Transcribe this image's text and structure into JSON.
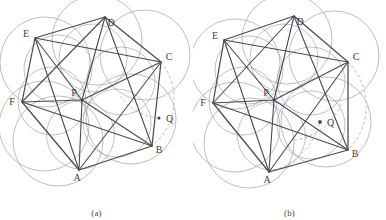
{
  "figure": {
    "type": "geometric-diagram",
    "background": "#ffffff",
    "width": 386,
    "height": 220,
    "stroke_colors": {
      "circle": "#8d8f9b",
      "polygon": "#4a4a52",
      "diagonal": "#4a4a52",
      "dashed_arc": "#b3b0ae",
      "point": "#3c3c3c"
    }
  },
  "panels": [
    {
      "id": "panel-a",
      "caption": "(a)",
      "origin_x": 0,
      "center": {
        "label": "P",
        "x": 82,
        "y": 100,
        "label_dx": -8,
        "label_dy": -4
      },
      "radius": 48,
      "circle_radius": 34,
      "vertices": [
        {
          "label": "A",
          "x": 79,
          "y": 170,
          "label_dx": -2,
          "label_dy": 11
        },
        {
          "label": "B",
          "x": 152,
          "y": 146,
          "label_dx": 7,
          "label_dy": 7
        },
        {
          "label": "C",
          "x": 161,
          "y": 62,
          "label_dx": 8,
          "label_dy": -2
        },
        {
          "label": "D",
          "x": 105,
          "y": 17,
          "label_dx": 6,
          "label_dy": 9
        },
        {
          "label": "E",
          "x": 35,
          "y": 38,
          "label_dx": -9,
          "label_dy": -1
        },
        {
          "label": "F",
          "x": 22,
          "y": 102,
          "label_dx": -10,
          "label_dy": 3
        }
      ],
      "marked_point": {
        "label": "Q",
        "x": 159,
        "y": 118,
        "marker": "dot",
        "label_dx": 7,
        "label_dy": 4
      },
      "circle_centers": [
        {
          "x": 80.5,
          "y": 135
        },
        {
          "x": 117,
          "y": 123
        },
        {
          "x": 121,
          "y": 81
        },
        {
          "x": 93,
          "y": 58
        },
        {
          "x": 58,
          "y": 69
        },
        {
          "x": 52,
          "y": 101
        }
      ],
      "outer_circles": [
        {
          "x": 58,
          "y": 141,
          "r": 45
        },
        {
          "x": 131,
          "y": 119,
          "r": 45
        },
        {
          "x": 145,
          "y": 55,
          "r": 45
        },
        {
          "x": 97,
          "y": 40,
          "r": 45
        },
        {
          "x": 45,
          "y": 62,
          "r": 45
        },
        {
          "x": 44,
          "y": 126,
          "r": 45
        }
      ],
      "diagonals": [
        [
          "P",
          "A"
        ],
        [
          "P",
          "B"
        ],
        [
          "P",
          "C"
        ],
        [
          "P",
          "D"
        ],
        [
          "P",
          "E"
        ],
        [
          "P",
          "F"
        ],
        [
          "A",
          "C"
        ],
        [
          "C",
          "E"
        ],
        [
          "E",
          "A"
        ],
        [
          "B",
          "D"
        ],
        [
          "D",
          "F"
        ],
        [
          "F",
          "B"
        ]
      ],
      "dashed_arcs": [
        {
          "from": [
            161,
            62
          ],
          "to": [
            152,
            146
          ],
          "sweep": 1,
          "r": 60
        },
        {
          "from": [
            120,
            96
          ],
          "to": [
            159,
            118
          ],
          "sweep": 0,
          "r": 52
        }
      ]
    },
    {
      "id": "panel-b",
      "caption": "(b)",
      "origin_x": 193,
      "center": {
        "label": "P",
        "x": 81,
        "y": 100,
        "label_dx": -8,
        "label_dy": -4
      },
      "radius": 48,
      "circle_radius": 34,
      "vertices": [
        {
          "label": "A",
          "x": 76,
          "y": 172,
          "label_dx": -2,
          "label_dy": 11
        },
        {
          "label": "B",
          "x": 155,
          "y": 150,
          "label_dx": 7,
          "label_dy": 7
        },
        {
          "label": "C",
          "x": 155,
          "y": 62,
          "label_dx": 8,
          "label_dy": -2
        },
        {
          "label": "D",
          "x": 101,
          "y": 16,
          "label_dx": 6,
          "label_dy": 9
        },
        {
          "label": "E",
          "x": 31,
          "y": 40,
          "label_dx": -9,
          "label_dy": -1
        },
        {
          "label": "F",
          "x": 20,
          "y": 103,
          "label_dx": -10,
          "label_dy": 3
        }
      ],
      "marked_point": {
        "label": "Q",
        "x": 127,
        "y": 122,
        "marker": "square",
        "label_dx": 7,
        "label_dy": 4
      },
      "circle_centers": [
        {
          "x": 78.5,
          "y": 136
        },
        {
          "x": 118,
          "y": 125
        },
        {
          "x": 118,
          "y": 81
        },
        {
          "x": 91,
          "y": 58
        },
        {
          "x": 56,
          "y": 70
        },
        {
          "x": 50,
          "y": 101
        }
      ],
      "outer_circles": [
        {
          "x": 56,
          "y": 143,
          "r": 45
        },
        {
          "x": 133,
          "y": 122,
          "r": 45
        },
        {
          "x": 141,
          "y": 56,
          "r": 45
        },
        {
          "x": 94,
          "y": 39,
          "r": 45
        },
        {
          "x": 42,
          "y": 64,
          "r": 45
        },
        {
          "x": 42,
          "y": 127,
          "r": 45
        }
      ],
      "diagonals": [
        [
          "P",
          "A"
        ],
        [
          "P",
          "B"
        ],
        [
          "P",
          "C"
        ],
        [
          "P",
          "D"
        ],
        [
          "P",
          "E"
        ],
        [
          "P",
          "F"
        ],
        [
          "A",
          "C"
        ],
        [
          "C",
          "E"
        ],
        [
          "E",
          "A"
        ],
        [
          "B",
          "D"
        ],
        [
          "D",
          "F"
        ],
        [
          "F",
          "B"
        ]
      ],
      "dashed_arcs": [
        {
          "from": [
            155,
            62
          ],
          "to": [
            155,
            150
          ],
          "sweep": 1,
          "r": 62
        },
        {
          "from": [
            76,
            172
          ],
          "to": [
            127,
            122
          ],
          "sweep": 0,
          "r": 70
        },
        {
          "from": [
            101,
            140
          ],
          "to": [
            148,
            104
          ],
          "sweep": 0,
          "r": 58
        }
      ]
    }
  ]
}
